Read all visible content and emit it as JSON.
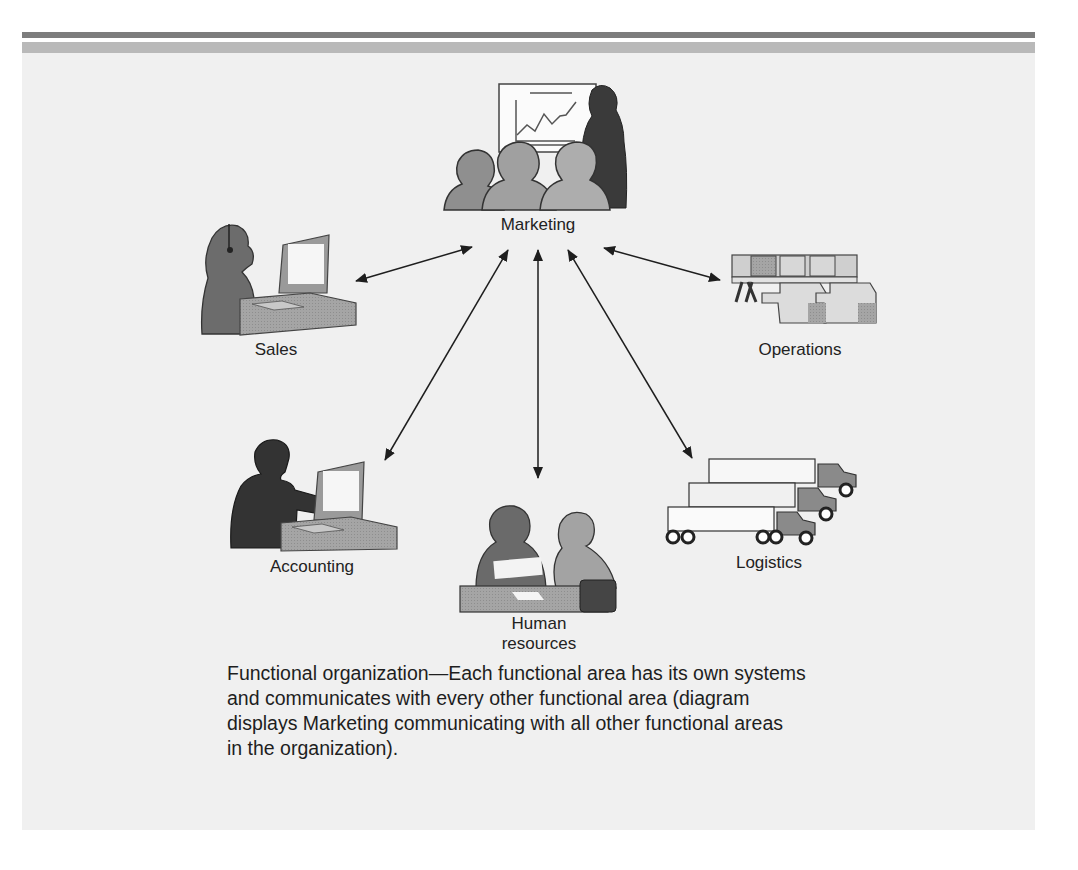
{
  "figure": {
    "type": "hub-and-spoke diagram",
    "hub": {
      "label": "Marketing",
      "icon": "presentation-audience-icon"
    },
    "nodes": [
      {
        "id": "sales",
        "label": "Sales",
        "icon": "headset-computer-operator-icon"
      },
      {
        "id": "operations",
        "label": "Operations",
        "icon": "conveyor-boxes-icon"
      },
      {
        "id": "accounting",
        "label": "Accounting",
        "icon": "computer-user-icon"
      },
      {
        "id": "human-resources",
        "label_line1": "Human",
        "label_line2": "resources",
        "icon": "meeting-people-icon"
      },
      {
        "id": "logistics",
        "label": "Logistics",
        "icon": "trucks-icon"
      }
    ],
    "connections": [
      {
        "from": "Marketing",
        "to": "Sales",
        "direction": "bidirectional"
      },
      {
        "from": "Marketing",
        "to": "Operations",
        "direction": "bidirectional"
      },
      {
        "from": "Marketing",
        "to": "Accounting",
        "direction": "bidirectional"
      },
      {
        "from": "Marketing",
        "to": "Human resources",
        "direction": "bidirectional"
      },
      {
        "from": "Marketing",
        "to": "Logistics",
        "direction": "bidirectional"
      }
    ]
  },
  "caption": {
    "lines": [
      "Functional organization—Each functional area has its own systems",
      "and communicates with every other functional area (diagram",
      "displays Marketing communicating with all other functional areas",
      "in the organization)."
    ]
  },
  "colors": {
    "panel_bg": "#f0f0f0",
    "band_dark": "#7d7d7d",
    "band_light": "#b9b9b9",
    "silhouette_dark": "#3c3c3c",
    "silhouette_mid": "#6e6e6e",
    "silhouette_light": "#9a9a9a",
    "arrow": "#1e1e1e"
  }
}
